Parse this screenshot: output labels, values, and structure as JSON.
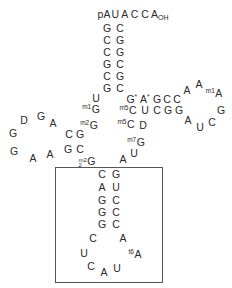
{
  "acceptor": {
    "five_prime": "pA",
    "three_prime_tail": "U A C C A",
    "three_prime_sub": "OH",
    "stem_left": [
      "G",
      "C",
      "C",
      "G",
      "C",
      "G"
    ],
    "stem_right": [
      "C",
      "G",
      "G",
      "C",
      "G",
      "C"
    ]
  },
  "connector": {
    "u": "U",
    "m1g_mod": "m1",
    "m1g_base": "G",
    "m2g_mod": "m2",
    "m2g_base": "G"
  },
  "d_arm": {
    "loop": [
      "D",
      "G",
      "A",
      "G",
      "G",
      "A",
      "A"
    ],
    "stem_top": [
      "C",
      "G"
    ],
    "stem_bottom": [
      "G",
      "C"
    ]
  },
  "m22g": {
    "sup": "m2",
    "sub": "2",
    "base": "G"
  },
  "t_arm": {
    "top_row": [
      "G",
      "A",
      "G",
      "C",
      "C",
      "A"
    ],
    "star": "*",
    "loop": [
      "A",
      "A",
      "G",
      "C",
      "U",
      "A"
    ],
    "m1a_mod": "m1",
    "mid_row_mod": "m5",
    "mid_row": [
      "C",
      "U",
      "C",
      "G",
      "G"
    ],
    "bottom_mod": "m5",
    "bottom_row": [
      "C",
      "D"
    ]
  },
  "variable": {
    "m7g_mod": "m7",
    "m7g_base": "G",
    "u": "U",
    "a": "A"
  },
  "anticodon_arm": {
    "stem_left": [
      "C",
      "A",
      "G",
      "G",
      "G"
    ],
    "stem_right": [
      "G",
      "U",
      "C",
      "C",
      "C"
    ],
    "loop": [
      "C",
      "U",
      "C",
      "A",
      "U",
      "A"
    ],
    "t6a_mod": "t6",
    "t6a_base": "A"
  }
}
